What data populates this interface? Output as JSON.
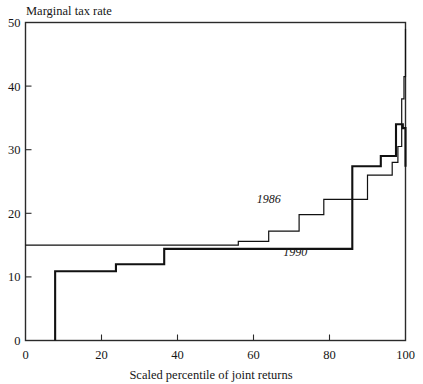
{
  "chart_data": {
    "type": "line",
    "title": "",
    "subtitle": "",
    "xlabel": "Scaled percentile of joint returns",
    "ylabel": "Marginal tax rate",
    "xlim": [
      0,
      100
    ],
    "ylim": [
      0,
      50
    ],
    "xticks": [
      0,
      20,
      40,
      60,
      80,
      100
    ],
    "yticks": [
      0,
      10,
      20,
      30,
      40,
      50
    ],
    "xtick_labels": [
      "0",
      "20",
      "40",
      "60",
      "80",
      "100"
    ],
    "ytick_labels": [
      "0",
      "10",
      "20",
      "30",
      "40",
      "50"
    ],
    "grid": false,
    "legend_position": "inline-annotations",
    "drawstyle": "steps-post",
    "series": [
      {
        "name": "1986",
        "label": "1986",
        "label_x": 64,
        "label_y": 21.6,
        "line_width": 1.2,
        "color": "#111111",
        "x": [
          0,
          48,
          56,
          64,
          72,
          78.5,
          90,
          94,
          96.5,
          98,
          99,
          99.6,
          100
        ],
        "values": [
          15,
          15,
          15.6,
          17.2,
          19.8,
          22.2,
          26,
          26,
          28,
          30.5,
          38,
          41.5,
          49
        ]
      },
      {
        "name": "1990",
        "label": "1990",
        "label_x": 71,
        "label_y": 13.3,
        "line_width": 2.1,
        "color": "#111111",
        "x": [
          7.8,
          7.8,
          15.8,
          23.8,
          36.5,
          78.5,
          86,
          93.5,
          97.5,
          99.3,
          100
        ],
        "values": [
          0,
          10.9,
          10.9,
          12,
          14.4,
          14.4,
          27.4,
          29,
          34,
          33.4,
          27.3
        ]
      }
    ],
    "annotations": [
      {
        "text": "1986",
        "x": 64,
        "y": 21.6
      },
      {
        "text": "1990",
        "x": 71,
        "y": 13.3
      }
    ]
  },
  "axes": {
    "y_axis_title": "Marginal tax rate",
    "x_axis_title": "Scaled percentile of joint returns"
  }
}
